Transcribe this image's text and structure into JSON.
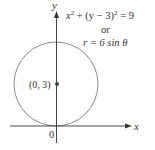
{
  "figure": {
    "axes": {
      "x_label": "x",
      "y_label": "y",
      "origin_label": "0"
    },
    "circle": {
      "center_label": "(0, 3)",
      "center": [
        0,
        3
      ],
      "radius": 3,
      "stroke_color": "#8a8a8a"
    },
    "equations": {
      "cartesian_lhs": "x",
      "cartesian_sup1": "2",
      "cartesian_mid": " + (y − 3)",
      "cartesian_sup2": "2",
      "cartesian_rhs": " = 9",
      "connector": "or",
      "polar": "r = 6 sin θ"
    },
    "colors": {
      "axis": "#333333",
      "text": "#333333",
      "circle": "#8a8a8a",
      "dot": "#444444"
    }
  }
}
